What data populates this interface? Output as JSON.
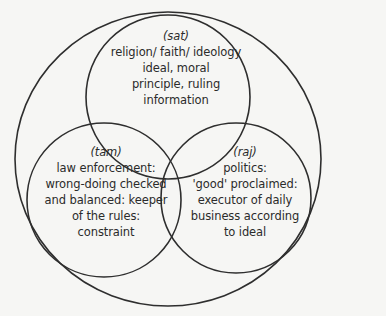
{
  "diagram": {
    "type": "venn",
    "background": "#f6f6f4",
    "stroke_color": "#2e2e2e",
    "text_color": "#2b2b2b",
    "outer_circle": {
      "cx": 168,
      "cy": 159,
      "rx": 153,
      "ry": 147
    },
    "circles": [
      {
        "id": "sat",
        "tag": "(sat)",
        "lines": [
          "religion/ faith/ ideology",
          "ideal, moral",
          "principle, ruling",
          "information"
        ],
        "cx": 168,
        "cy": 97,
        "r": 82
      },
      {
        "id": "tam",
        "tag": "(tam)",
        "lines": [
          "law enforcement:",
          "wrong-doing checked",
          "and balanced: keeper",
          "of the rules:",
          "constraint"
        ],
        "cx": 104,
        "cy": 200,
        "r": 77
      },
      {
        "id": "raj",
        "tag": "(raj)",
        "lines": [
          "politics:",
          "'good' proclaimed:",
          "executor of daily",
          "business according",
          "to ideal"
        ],
        "cx": 236,
        "cy": 198,
        "r": 75
      }
    ]
  }
}
